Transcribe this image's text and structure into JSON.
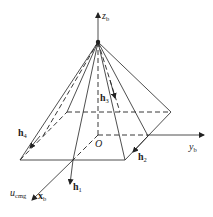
{
  "diagram": {
    "type": "pyramid-cmg-configuration",
    "axes": {
      "z": {
        "name": "z",
        "sub": "b"
      },
      "y": {
        "name": "y",
        "sub": "b"
      },
      "x": {
        "name": "x",
        "sub": "b"
      },
      "origin": "O"
    },
    "vectors": [
      {
        "name": "h",
        "sub": "1"
      },
      {
        "name": "h",
        "sub": "2"
      },
      {
        "name": "h",
        "sub": "3"
      },
      {
        "name": "h",
        "sub": "4"
      }
    ],
    "u_label": {
      "name": "u",
      "sub": "cmg"
    }
  }
}
